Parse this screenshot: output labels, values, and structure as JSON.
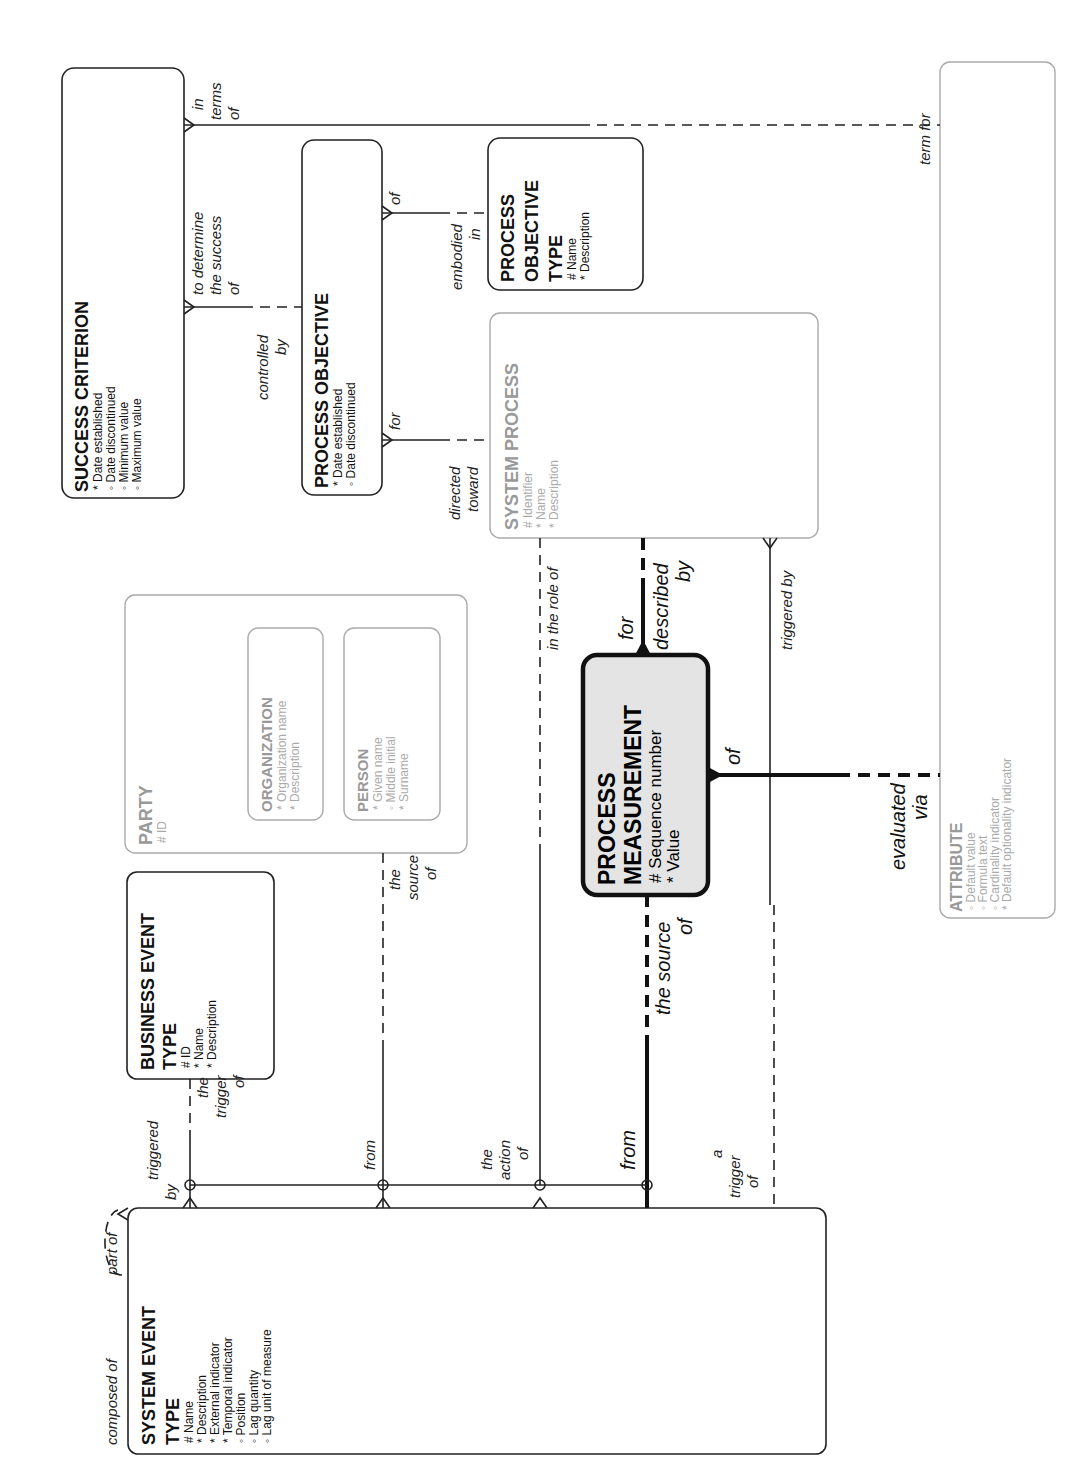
{
  "diagram": {
    "orientation": "rotated-90-ccw",
    "colors": {
      "line": "#222222",
      "gray_entity": "#aaaaaa",
      "highlight_fill": "#e4e4e4"
    },
    "entities": {
      "success_criterion": {
        "title": "SUCCESS CRITERION",
        "attributes": [
          "* Date established",
          "◦ Date discontinued",
          "◦ Minimum value",
          "◦ Maximum value"
        ]
      },
      "process_objective": {
        "title": "PROCESS OBJECTIVE",
        "attributes": [
          "* Date established",
          "◦ Date discontinued"
        ]
      },
      "process_objective_type": {
        "title_lines": [
          "PROCESS",
          "OBJECTIVE",
          "TYPE"
        ],
        "attributes": [
          "# Name",
          "* Description"
        ]
      },
      "system_process": {
        "title": "SYSTEM PROCESS",
        "attributes": [
          "# Identifier",
          "* Name",
          "* Description"
        ]
      },
      "party": {
        "title": "PARTY",
        "attributes": [
          "# ID"
        ]
      },
      "organization": {
        "title": "ORGANIZATION",
        "attributes": [
          "* Organization name",
          "* Description"
        ]
      },
      "person": {
        "title": "PERSON",
        "attributes": [
          "* Given name",
          "◦ Middle initial",
          "* Surname"
        ]
      },
      "process_measurement": {
        "title_lines": [
          "PROCESS",
          "MEASUREMENT"
        ],
        "attributes": [
          "# Sequence number",
          "*  Value"
        ]
      },
      "business_event_type": {
        "title_lines": [
          "BUSINESS EVENT",
          "TYPE"
        ],
        "attributes": [
          "# ID",
          "* Name",
          "* Description"
        ]
      },
      "system_event_type": {
        "title_lines": [
          "SYSTEM EVENT",
          "TYPE"
        ],
        "attributes": [
          "# Name",
          "* Description",
          "* External indicator",
          "* Temporal indicator",
          "◦ Position",
          "◦ Lag quantity",
          "◦ Lag unit of measure"
        ]
      },
      "attribute": {
        "title": "ATTRIBUTE",
        "attributes": [
          "◦ Default value",
          "◦ Formula text",
          "◦ Cardinality indicator",
          "* Default optionality indicator"
        ]
      }
    },
    "relationship_labels": {
      "in_terms_of": [
        "in",
        "terms",
        "of"
      ],
      "term_for": "term for",
      "to_determine": [
        "to determine",
        "the success",
        "of"
      ],
      "controlled_by": [
        "controlled",
        "by"
      ],
      "of_pot": "of",
      "embodied_in": [
        "embodied",
        "in"
      ],
      "for_po": "for",
      "directed_toward": [
        "directed",
        "toward"
      ],
      "in_the_role_of": "in the role of",
      "for_pm": "for",
      "described_by": [
        "described",
        "by"
      ],
      "triggered_by_sp": "triggered by",
      "of_pm": "of",
      "evaluated_via": [
        "evaluated",
        "via"
      ],
      "the_source_of_party": [
        "the",
        "source",
        "of"
      ],
      "the_source_of_pm": [
        "the source",
        "of"
      ],
      "the_trigger_of": [
        "the",
        "trigger",
        "of"
      ],
      "triggered_by_set": [
        "triggered",
        "by"
      ],
      "from_party": "from",
      "the_action_of": [
        "the",
        "action",
        "of"
      ],
      "from_pm": "from",
      "a_trigger_of": [
        "a",
        "trigger",
        "of"
      ],
      "composed_of": "composed of",
      "part_of": "part of"
    }
  }
}
